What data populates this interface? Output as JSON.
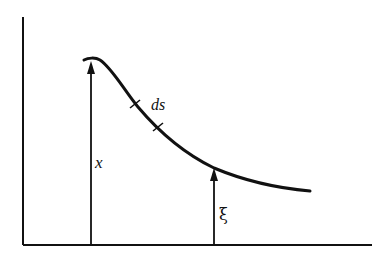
{
  "diagram": {
    "type": "curve-with-arc-length",
    "labels": {
      "x": "x",
      "ds": "ds",
      "xi": "ξ"
    },
    "colors": {
      "stroke": "#111111",
      "background": "#ffffff"
    },
    "axes": {
      "vertical": {
        "x": 23,
        "y_top": 17,
        "y_bottom": 245
      },
      "horizontal": {
        "y": 245,
        "x_left": 23,
        "x_right": 372
      }
    },
    "curve": {
      "start": [
        84,
        60
      ],
      "peak": [
        93,
        58
      ],
      "tick_marks": [
        [
          135,
          104
        ],
        [
          158,
          127
        ]
      ],
      "xi_intersection": [
        214,
        168
      ],
      "end": [
        310,
        191
      ]
    },
    "arrows": [
      {
        "name": "x",
        "x": 91,
        "from_y": 245,
        "to_y": 61
      },
      {
        "name": "xi",
        "x": 214,
        "from_y": 245,
        "to_y": 168
      }
    ]
  }
}
